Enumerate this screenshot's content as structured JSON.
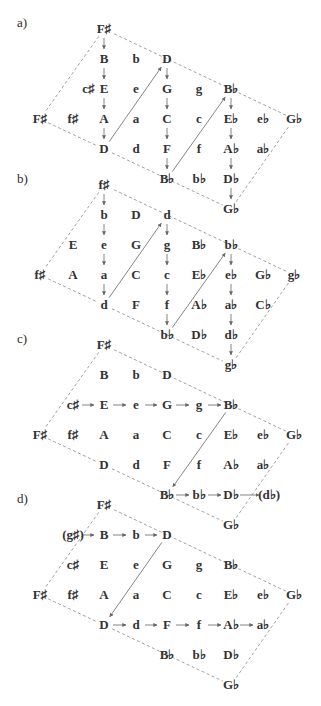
{
  "columns_x": [
    40,
    73,
    104,
    136,
    167,
    199,
    231,
    263,
    294
  ],
  "row_step": 30,
  "sections": [
    {
      "label": "a)",
      "label_pos": [
        17,
        27
      ],
      "top_y": 33,
      "nodes": [
        {
          "text": "F♯",
          "col": 1,
          "row": 0
        },
        {
          "text": "B",
          "col": 1,
          "row": 1
        },
        {
          "text": "b",
          "col": 2,
          "row": 1
        },
        {
          "text": "D",
          "col": 3,
          "row": 1
        },
        {
          "text": "c♯",
          "col": 0.5,
          "row": 2,
          "x": 73
        },
        {
          "text": "E",
          "col": 1,
          "row": 2
        },
        {
          "text": "e",
          "col": 2,
          "row": 2
        },
        {
          "text": "G",
          "col": 3,
          "row": 2
        },
        {
          "text": "g",
          "col": 4,
          "row": 2
        },
        {
          "text": "B♭",
          "col": 5,
          "row": 2
        },
        {
          "text": "F♯",
          "col": -1,
          "row": 3
        },
        {
          "text": "f♯",
          "col": 0,
          "row": 3
        },
        {
          "text": "A",
          "col": 1,
          "row": 3
        },
        {
          "text": "a",
          "col": 2,
          "row": 3
        },
        {
          "text": "C",
          "col": 3,
          "row": 3
        },
        {
          "text": "c",
          "col": 4,
          "row": 3
        },
        {
          "text": "E♭",
          "col": 5,
          "row": 3
        },
        {
          "text": "e♭",
          "col": 6,
          "row": 3
        },
        {
          "text": "G♭",
          "col": 7,
          "row": 3
        },
        {
          "text": "D",
          "col": 1,
          "row": 4
        },
        {
          "text": "d",
          "col": 2,
          "row": 4
        },
        {
          "text": "F",
          "col": 3,
          "row": 4
        },
        {
          "text": "f",
          "col": 4,
          "row": 4
        },
        {
          "text": "A♭",
          "col": 5,
          "row": 4
        },
        {
          "text": "a♭",
          "col": 6,
          "row": 4
        },
        {
          "text": "B♭",
          "col": 3,
          "row": 5
        },
        {
          "text": "b♭",
          "col": 4,
          "row": 5
        },
        {
          "text": "D♭",
          "col": 5,
          "row": 5
        },
        {
          "text": "G♭",
          "col": 5,
          "row": 6
        }
      ],
      "arrows": [
        [
          [
            1,
            0
          ],
          [
            1,
            1
          ]
        ],
        [
          [
            1,
            1
          ],
          [
            1,
            2
          ]
        ],
        [
          [
            1,
            2
          ],
          [
            1,
            3
          ]
        ],
        [
          [
            1,
            3
          ],
          [
            1,
            4
          ]
        ],
        [
          [
            1,
            4
          ],
          [
            3,
            1
          ]
        ],
        [
          [
            3,
            1
          ],
          [
            3,
            2
          ]
        ],
        [
          [
            3,
            2
          ],
          [
            3,
            3
          ]
        ],
        [
          [
            3,
            3
          ],
          [
            3,
            4
          ]
        ],
        [
          [
            3,
            4
          ],
          [
            3,
            5
          ]
        ],
        [
          [
            3,
            5
          ],
          [
            5,
            2
          ]
        ],
        [
          [
            5,
            2
          ],
          [
            5,
            3
          ]
        ],
        [
          [
            5,
            3
          ],
          [
            5,
            4
          ]
        ],
        [
          [
            5,
            4
          ],
          [
            5,
            5
          ]
        ],
        [
          [
            5,
            5
          ],
          [
            5,
            6
          ]
        ]
      ]
    },
    {
      "label": "b)",
      "label_pos": [
        17,
        183
      ],
      "top_y": 189,
      "nodes": [
        {
          "text": "f♯",
          "col": 1,
          "row": 0
        },
        {
          "text": "b",
          "col": 1,
          "row": 1
        },
        {
          "text": "D",
          "col": 2,
          "row": 1
        },
        {
          "text": "d",
          "col": 3,
          "row": 1
        },
        {
          "text": "E",
          "col": 0,
          "row": 2
        },
        {
          "text": "e",
          "col": 1,
          "row": 2
        },
        {
          "text": "G",
          "col": 2,
          "row": 2
        },
        {
          "text": "g",
          "col": 3,
          "row": 2
        },
        {
          "text": "B♭",
          "col": 4,
          "row": 2
        },
        {
          "text": "b♭",
          "col": 5,
          "row": 2
        },
        {
          "text": "f♯",
          "col": -1,
          "row": 3
        },
        {
          "text": "A",
          "col": 0,
          "row": 3
        },
        {
          "text": "a",
          "col": 1,
          "row": 3
        },
        {
          "text": "C",
          "col": 2,
          "row": 3
        },
        {
          "text": "c",
          "col": 3,
          "row": 3
        },
        {
          "text": "E♭",
          "col": 4,
          "row": 3
        },
        {
          "text": "e♭",
          "col": 5,
          "row": 3
        },
        {
          "text": "G♭",
          "col": 6,
          "row": 3
        },
        {
          "text": "g♭",
          "col": 7,
          "row": 3
        },
        {
          "text": "d",
          "col": 1,
          "row": 4
        },
        {
          "text": "F",
          "col": 2,
          "row": 4
        },
        {
          "text": "f",
          "col": 3,
          "row": 4
        },
        {
          "text": "A♭",
          "col": 4,
          "row": 4
        },
        {
          "text": "a♭",
          "col": 5,
          "row": 4
        },
        {
          "text": "C♭",
          "col": 6,
          "row": 4
        },
        {
          "text": "b♭",
          "col": 3,
          "row": 5
        },
        {
          "text": "D♭",
          "col": 4,
          "row": 5
        },
        {
          "text": "d♭",
          "col": 5,
          "row": 5
        },
        {
          "text": "g♭",
          "col": 5,
          "row": 6
        }
      ],
      "arrows": [
        [
          [
            1,
            0
          ],
          [
            1,
            1
          ]
        ],
        [
          [
            1,
            1
          ],
          [
            1,
            2
          ]
        ],
        [
          [
            1,
            2
          ],
          [
            1,
            3
          ]
        ],
        [
          [
            1,
            3
          ],
          [
            1,
            4
          ]
        ],
        [
          [
            1,
            4
          ],
          [
            3,
            1
          ]
        ],
        [
          [
            3,
            1
          ],
          [
            3,
            2
          ]
        ],
        [
          [
            3,
            2
          ],
          [
            3,
            3
          ]
        ],
        [
          [
            3,
            3
          ],
          [
            3,
            4
          ]
        ],
        [
          [
            3,
            4
          ],
          [
            3,
            5
          ]
        ],
        [
          [
            3,
            5
          ],
          [
            5,
            2
          ]
        ],
        [
          [
            5,
            2
          ],
          [
            5,
            3
          ]
        ],
        [
          [
            5,
            3
          ],
          [
            5,
            4
          ]
        ],
        [
          [
            5,
            4
          ],
          [
            5,
            5
          ]
        ],
        [
          [
            5,
            5
          ],
          [
            5,
            6
          ]
        ]
      ]
    },
    {
      "label": "c)",
      "label_pos": [
        17,
        343
      ],
      "top_y": 349,
      "nodes": [
        {
          "text": "F♯",
          "col": 1,
          "row": 0
        },
        {
          "text": "B",
          "col": 1,
          "row": 1
        },
        {
          "text": "b",
          "col": 2,
          "row": 1
        },
        {
          "text": "D",
          "col": 3,
          "row": 1
        },
        {
          "text": "c♯",
          "col": 0,
          "row": 2
        },
        {
          "text": "E",
          "col": 1,
          "row": 2
        },
        {
          "text": "e",
          "col": 2,
          "row": 2
        },
        {
          "text": "G",
          "col": 3,
          "row": 2
        },
        {
          "text": "g",
          "col": 4,
          "row": 2
        },
        {
          "text": "B♭",
          "col": 5,
          "row": 2
        },
        {
          "text": "F♯",
          "col": -1,
          "row": 3
        },
        {
          "text": "f♯",
          "col": 0,
          "row": 3
        },
        {
          "text": "A",
          "col": 1,
          "row": 3
        },
        {
          "text": "a",
          "col": 2,
          "row": 3
        },
        {
          "text": "C",
          "col": 3,
          "row": 3
        },
        {
          "text": "c",
          "col": 4,
          "row": 3
        },
        {
          "text": "E♭",
          "col": 5,
          "row": 3
        },
        {
          "text": "e♭",
          "col": 6,
          "row": 3
        },
        {
          "text": "G♭",
          "col": 7,
          "row": 3
        },
        {
          "text": "D",
          "col": 1,
          "row": 4
        },
        {
          "text": "d",
          "col": 2,
          "row": 4
        },
        {
          "text": "F",
          "col": 3,
          "row": 4
        },
        {
          "text": "f",
          "col": 4,
          "row": 4
        },
        {
          "text": "A♭",
          "col": 5,
          "row": 4
        },
        {
          "text": "a♭",
          "col": 6,
          "row": 4
        },
        {
          "text": "B♭",
          "col": 3,
          "row": 5
        },
        {
          "text": "b♭",
          "col": 4,
          "row": 5
        },
        {
          "text": "D♭",
          "col": 5,
          "row": 5
        },
        {
          "text": "(d♭)",
          "col": 6.2,
          "row": 5
        },
        {
          "text": "G♭",
          "col": 5,
          "row": 6
        }
      ],
      "arrows": [
        [
          [
            0,
            2
          ],
          [
            1,
            2
          ]
        ],
        [
          [
            1,
            2
          ],
          [
            2,
            2
          ]
        ],
        [
          [
            2,
            2
          ],
          [
            3,
            2
          ]
        ],
        [
          [
            3,
            2
          ],
          [
            4,
            2
          ]
        ],
        [
          [
            4,
            2
          ],
          [
            5,
            2
          ]
        ],
        [
          [
            5,
            2
          ],
          [
            3,
            5
          ]
        ],
        [
          [
            3,
            5
          ],
          [
            4,
            5
          ]
        ],
        [
          [
            4,
            5
          ],
          [
            5,
            5
          ]
        ],
        [
          [
            5,
            5
          ],
          [
            6.2,
            5
          ]
        ]
      ]
    },
    {
      "label": "d)",
      "label_pos": [
        17,
        503
      ],
      "top_y": 509,
      "nodes": [
        {
          "text": "F♯",
          "col": 1,
          "row": 0
        },
        {
          "text": "(g♯)",
          "col": 0,
          "row": 1
        },
        {
          "text": "B",
          "col": 1,
          "row": 1
        },
        {
          "text": "b",
          "col": 2,
          "row": 1
        },
        {
          "text": "D",
          "col": 3,
          "row": 1
        },
        {
          "text": "c♯",
          "col": 0,
          "row": 2
        },
        {
          "text": "E",
          "col": 1,
          "row": 2
        },
        {
          "text": "e",
          "col": 2,
          "row": 2
        },
        {
          "text": "G",
          "col": 3,
          "row": 2
        },
        {
          "text": "g",
          "col": 4,
          "row": 2
        },
        {
          "text": "B♭",
          "col": 5,
          "row": 2
        },
        {
          "text": "F♯",
          "col": -1,
          "row": 3
        },
        {
          "text": "f♯",
          "col": 0,
          "row": 3
        },
        {
          "text": "A",
          "col": 1,
          "row": 3
        },
        {
          "text": "a",
          "col": 2,
          "row": 3
        },
        {
          "text": "C",
          "col": 3,
          "row": 3
        },
        {
          "text": "c",
          "col": 4,
          "row": 3
        },
        {
          "text": "E♭",
          "col": 5,
          "row": 3
        },
        {
          "text": "e♭",
          "col": 6,
          "row": 3
        },
        {
          "text": "G♭",
          "col": 7,
          "row": 3
        },
        {
          "text": "D",
          "col": 1,
          "row": 4
        },
        {
          "text": "d",
          "col": 2,
          "row": 4
        },
        {
          "text": "F",
          "col": 3,
          "row": 4
        },
        {
          "text": "f",
          "col": 4,
          "row": 4
        },
        {
          "text": "A♭",
          "col": 5,
          "row": 4
        },
        {
          "text": "a♭",
          "col": 6,
          "row": 4
        },
        {
          "text": "B♭",
          "col": 3,
          "row": 5
        },
        {
          "text": "b♭",
          "col": 4,
          "row": 5
        },
        {
          "text": "D♭",
          "col": 5,
          "row": 5
        },
        {
          "text": "G♭",
          "col": 5,
          "row": 6
        }
      ],
      "arrows": [
        [
          [
            0,
            1
          ],
          [
            1,
            1
          ]
        ],
        [
          [
            1,
            1
          ],
          [
            2,
            1
          ]
        ],
        [
          [
            2,
            1
          ],
          [
            3,
            1
          ]
        ],
        [
          [
            3,
            1
          ],
          [
            1,
            4
          ]
        ],
        [
          [
            1,
            4
          ],
          [
            2,
            4
          ]
        ],
        [
          [
            2,
            4
          ],
          [
            3,
            4
          ]
        ],
        [
          [
            3,
            4
          ],
          [
            4,
            4
          ]
        ],
        [
          [
            4,
            4
          ],
          [
            5,
            4
          ]
        ],
        [
          [
            5,
            4
          ],
          [
            6,
            4
          ]
        ]
      ]
    }
  ]
}
